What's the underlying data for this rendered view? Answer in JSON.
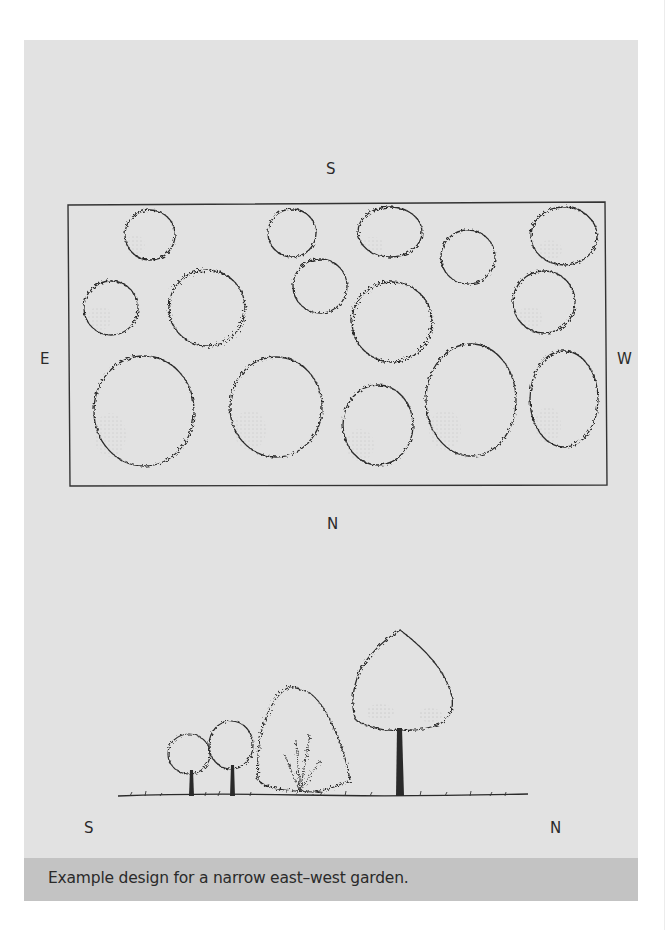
{
  "figure": {
    "caption": "Example design for a narrow east–west garden.",
    "background_color": "#e2e2e2",
    "caption_band_color": "#c3c3c3"
  },
  "plan_view": {
    "labels": {
      "top": "S",
      "bottom": "N",
      "left": "E",
      "right": "W"
    },
    "plant_count": 16
  },
  "elevation_view": {
    "labels": {
      "left": "S",
      "right": "N"
    },
    "plants": [
      "small-tree",
      "small-tree",
      "shrub",
      "tall-tree"
    ]
  }
}
